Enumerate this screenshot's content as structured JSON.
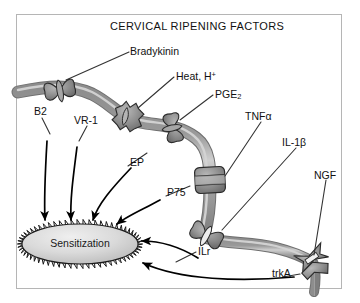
{
  "figure": {
    "title": "CERVICAL RIPENING FACTORS",
    "border_color": "#b5b5b5",
    "background": "#ffffff",
    "nerve_color": "#8c8c8c",
    "nerve_highlight": "#c9c9c9",
    "receptor_color": "#8a8a8a",
    "arrow_color": "#000000",
    "leader_color": "#333333",
    "type": "biological-signaling-diagram"
  },
  "ligands": [
    {
      "id": "bradykinin",
      "label": "Bradykinin"
    },
    {
      "id": "heat-h",
      "label": "Heat, H",
      "sup": "+"
    },
    {
      "id": "pge2",
      "label": "PGE",
      "sub": "2"
    },
    {
      "id": "tnfa",
      "label": "TNFα"
    },
    {
      "id": "il1b",
      "label": "IL-1β"
    },
    {
      "id": "ngf",
      "label": "NGF"
    }
  ],
  "receptors": [
    {
      "id": "b2",
      "label": "B2",
      "ligand": "Bradykinin",
      "shape": "butterfly"
    },
    {
      "id": "vr1",
      "label": "VR-1",
      "ligand": "Heat, H+",
      "shape": "starburst"
    },
    {
      "id": "ep",
      "label": "EP",
      "ligand": "PGE2",
      "shape": "butterfly"
    },
    {
      "id": "p75",
      "label": "P75",
      "ligand": "TNFα",
      "shape": "barrel"
    },
    {
      "id": "ilr",
      "label": "ILr",
      "ligand": "IL-1β",
      "shape": "butterfly"
    },
    {
      "id": "trka",
      "label": "trkA",
      "ligand": "NGF",
      "shape": "bowtie"
    }
  ],
  "outcome": {
    "id": "sensitization",
    "label": "Sensitization",
    "shape": "starburst-ellipse",
    "fill": "#d9d9d9"
  },
  "edges": [
    {
      "from": "b2",
      "to": "sensitization"
    },
    {
      "from": "vr1",
      "to": "sensitization"
    },
    {
      "from": "ep",
      "to": "sensitization"
    },
    {
      "from": "p75",
      "to": "sensitization"
    },
    {
      "from": "ilr",
      "to": "sensitization"
    },
    {
      "from": "trka",
      "to": "sensitization"
    }
  ]
}
